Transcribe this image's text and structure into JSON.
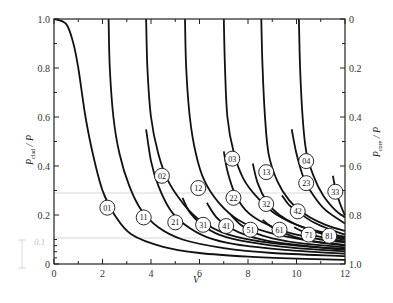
{
  "chart_data": {
    "type": "line",
    "title": "",
    "xlabel": "V",
    "ylabel": "P_clad / P",
    "ylabel_right": "P_core / P",
    "xlim": [
      0,
      12
    ],
    "ylim": [
      0,
      1.0
    ],
    "ylim_right": [
      1.0,
      0
    ],
    "x_ticks": [
      0,
      2,
      4,
      6,
      8,
      10,
      12
    ],
    "x_tick_labels": [
      "0",
      "2",
      "4",
      "6",
      "8",
      "10",
      "12"
    ],
    "y_ticks": [
      0,
      0.2,
      0.4,
      0.6,
      0.8,
      1.0
    ],
    "y_tick_labels": [
      "0",
      "0.2",
      "0.4",
      "0.6",
      "0.8",
      "1.0"
    ],
    "y_right_tick_labels": [
      "1.0",
      "0.8",
      "0.6",
      "0.4",
      "0.2",
      "0"
    ],
    "grid": false,
    "legend": "none (curves labeled inline)",
    "annotations": {
      "faint_label": "0.1"
    },
    "series": [
      {
        "name": "01",
        "label_pos": [
          2.2,
          0.23
        ],
        "points": [
          [
            0,
            1.0
          ],
          [
            0.5,
            0.98
          ],
          [
            0.8,
            0.9
          ],
          [
            1.0,
            0.8
          ],
          [
            1.3,
            0.6
          ],
          [
            1.6,
            0.45
          ],
          [
            2.0,
            0.3
          ],
          [
            2.5,
            0.2
          ],
          [
            3.2,
            0.12
          ],
          [
            4.5,
            0.07
          ],
          [
            6,
            0.045
          ],
          [
            8,
            0.03
          ],
          [
            10,
            0.022
          ],
          [
            12,
            0.017
          ]
        ]
      },
      {
        "name": "11",
        "label_pos": [
          3.7,
          0.19
        ],
        "points": [
          [
            2.25,
            1.0
          ],
          [
            2.3,
            0.8
          ],
          [
            2.45,
            0.6
          ],
          [
            2.7,
            0.45
          ],
          [
            3.1,
            0.32
          ],
          [
            3.6,
            0.22
          ],
          [
            4.3,
            0.15
          ],
          [
            5.3,
            0.1
          ],
          [
            7,
            0.065
          ],
          [
            9,
            0.045
          ],
          [
            12,
            0.032
          ]
        ]
      },
      {
        "name": "21",
        "label_pos": [
          5.0,
          0.17
        ],
        "points": [
          [
            3.8,
            0.55
          ],
          [
            4.0,
            0.42
          ],
          [
            4.3,
            0.32
          ],
          [
            4.8,
            0.22
          ],
          [
            5.4,
            0.16
          ],
          [
            6.3,
            0.11
          ],
          [
            7.5,
            0.08
          ],
          [
            9.5,
            0.058
          ],
          [
            12,
            0.042
          ]
        ]
      },
      {
        "name": "02",
        "label_pos": [
          4.45,
          0.36
        ],
        "points": [
          [
            3.8,
            1.0
          ],
          [
            3.85,
            0.8
          ],
          [
            4.0,
            0.6
          ],
          [
            4.3,
            0.45
          ],
          [
            4.7,
            0.34
          ],
          [
            5.3,
            0.25
          ],
          [
            6.0,
            0.18
          ],
          [
            7.2,
            0.12
          ],
          [
            9,
            0.085
          ],
          [
            12,
            0.058
          ]
        ]
      },
      {
        "name": "12",
        "label_pos": [
          5.95,
          0.31
        ],
        "points": [
          [
            5.4,
            1.0
          ],
          [
            5.45,
            0.8
          ],
          [
            5.6,
            0.6
          ],
          [
            5.85,
            0.45
          ],
          [
            6.2,
            0.34
          ],
          [
            6.8,
            0.25
          ],
          [
            7.6,
            0.18
          ],
          [
            8.8,
            0.13
          ],
          [
            10.5,
            0.095
          ],
          [
            12,
            0.078
          ]
        ]
      },
      {
        "name": "31",
        "label_pos": [
          6.15,
          0.16
        ],
        "points": [
          [
            5.3,
            0.27
          ],
          [
            5.6,
            0.21
          ],
          [
            6.1,
            0.16
          ],
          [
            6.8,
            0.12
          ],
          [
            8,
            0.09
          ],
          [
            10,
            0.065
          ],
          [
            12,
            0.052
          ]
        ]
      },
      {
        "name": "03",
        "label_pos": [
          7.35,
          0.43
        ],
        "points": [
          [
            7.0,
            1.0
          ],
          [
            7.05,
            0.8
          ],
          [
            7.15,
            0.6
          ],
          [
            7.4,
            0.46
          ],
          [
            7.8,
            0.35
          ],
          [
            8.4,
            0.27
          ],
          [
            9.2,
            0.2
          ],
          [
            10.3,
            0.15
          ],
          [
            12,
            0.11
          ]
        ]
      },
      {
        "name": "22",
        "label_pos": [
          7.4,
          0.27
        ],
        "points": [
          [
            7.0,
            0.46
          ],
          [
            7.15,
            0.38
          ],
          [
            7.45,
            0.29
          ],
          [
            7.9,
            0.22
          ],
          [
            8.6,
            0.17
          ],
          [
            9.6,
            0.13
          ],
          [
            11,
            0.1
          ],
          [
            12,
            0.088
          ]
        ]
      },
      {
        "name": "41",
        "label_pos": [
          7.1,
          0.155
        ],
        "points": [
          [
            6.3,
            0.25
          ],
          [
            6.7,
            0.19
          ],
          [
            7.2,
            0.15
          ],
          [
            8,
            0.115
          ],
          [
            9.2,
            0.088
          ],
          [
            10.8,
            0.07
          ],
          [
            12,
            0.062
          ]
        ]
      },
      {
        "name": "51",
        "label_pos": [
          8.1,
          0.14
        ],
        "points": [
          [
            7.3,
            0.2
          ],
          [
            7.7,
            0.16
          ],
          [
            8.2,
            0.13
          ],
          [
            9,
            0.105
          ],
          [
            10.3,
            0.083
          ],
          [
            12,
            0.068
          ]
        ]
      },
      {
        "name": "13",
        "label_pos": [
          8.75,
          0.375
        ],
        "points": [
          [
            8.55,
            1.0
          ],
          [
            8.6,
            0.8
          ],
          [
            8.7,
            0.6
          ],
          [
            8.85,
            0.45
          ],
          [
            9.2,
            0.34
          ],
          [
            9.7,
            0.26
          ],
          [
            10.4,
            0.2
          ],
          [
            11.2,
            0.16
          ],
          [
            12,
            0.135
          ]
        ]
      },
      {
        "name": "32",
        "label_pos": [
          8.75,
          0.245
        ],
        "points": [
          [
            8.2,
            0.41
          ],
          [
            8.4,
            0.33
          ],
          [
            8.8,
            0.25
          ],
          [
            9.3,
            0.2
          ],
          [
            10,
            0.16
          ],
          [
            11,
            0.125
          ],
          [
            12,
            0.105
          ]
        ]
      },
      {
        "name": "61",
        "label_pos": [
          9.3,
          0.14
        ],
        "points": [
          [
            8.6,
            0.18
          ],
          [
            9,
            0.15
          ],
          [
            9.5,
            0.125
          ],
          [
            10.3,
            0.1
          ],
          [
            11.3,
            0.083
          ],
          [
            12,
            0.076
          ]
        ]
      },
      {
        "name": "04",
        "label_pos": [
          10.4,
          0.42
        ],
        "points": [
          [
            10.1,
            1.0
          ],
          [
            10.15,
            0.8
          ],
          [
            10.25,
            0.6
          ],
          [
            10.4,
            0.46
          ],
          [
            10.7,
            0.36
          ],
          [
            11.1,
            0.28
          ],
          [
            11.6,
            0.22
          ],
          [
            12,
            0.19
          ]
        ]
      },
      {
        "name": "23",
        "label_pos": [
          10.4,
          0.33
        ],
        "points": [
          [
            9.8,
            0.55
          ],
          [
            10.0,
            0.45
          ],
          [
            10.3,
            0.35
          ],
          [
            10.7,
            0.28
          ],
          [
            11.2,
            0.22
          ],
          [
            12,
            0.165
          ]
        ]
      },
      {
        "name": "42",
        "label_pos": [
          10.05,
          0.215
        ],
        "points": [
          [
            9.4,
            0.28
          ],
          [
            9.7,
            0.24
          ],
          [
            10.1,
            0.21
          ],
          [
            10.7,
            0.17
          ],
          [
            11.4,
            0.14
          ],
          [
            12,
            0.12
          ]
        ]
      },
      {
        "name": "71",
        "label_pos": [
          10.5,
          0.12
        ],
        "points": [
          [
            9.9,
            0.15
          ],
          [
            10.3,
            0.13
          ],
          [
            10.8,
            0.115
          ],
          [
            11.5,
            0.1
          ],
          [
            12,
            0.092
          ]
        ]
      },
      {
        "name": "81",
        "label_pos": [
          11.35,
          0.115
        ],
        "points": [
          [
            10.9,
            0.13
          ],
          [
            11.3,
            0.115
          ],
          [
            11.7,
            0.105
          ],
          [
            12,
            0.098
          ]
        ]
      },
      {
        "name": "33",
        "label_pos": [
          11.6,
          0.295
        ],
        "points": [
          [
            11.5,
            0.36
          ],
          [
            11.6,
            0.31
          ],
          [
            11.75,
            0.26
          ],
          [
            11.9,
            0.22
          ],
          [
            12,
            0.2
          ]
        ]
      }
    ]
  }
}
